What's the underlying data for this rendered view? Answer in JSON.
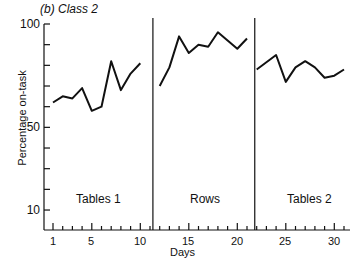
{
  "title": "(b) Class 2",
  "chart_data": {
    "type": "line",
    "title": "(b) Class 2",
    "xlabel": "Days",
    "ylabel": "Percentage on-task",
    "ylim": [
      0,
      100
    ],
    "xlim": [
      0,
      32
    ],
    "y_ticks": [
      10,
      50,
      100
    ],
    "x_ticks": [
      1,
      5,
      10,
      15,
      20,
      25,
      30
    ],
    "grid": false,
    "phase_dividers": [
      11.3,
      21.8
    ],
    "phases": [
      {
        "name": "Tables 1",
        "x": [
          1,
          2,
          3,
          4,
          5,
          6,
          7,
          8,
          9,
          10
        ],
        "values": [
          62,
          65,
          64,
          69,
          58,
          60,
          82,
          68,
          76,
          81
        ]
      },
      {
        "name": "Rows",
        "x": [
          12,
          13,
          14,
          15,
          16,
          17,
          18,
          19,
          20,
          21
        ],
        "values": [
          70,
          79,
          94,
          86,
          90,
          89,
          96,
          92,
          88,
          93
        ]
      },
      {
        "name": "Tables 2",
        "x": [
          22,
          24,
          25,
          26,
          27,
          28,
          29,
          30,
          31
        ],
        "values": [
          78,
          85,
          72,
          79,
          82,
          79,
          74,
          75,
          78
        ]
      }
    ]
  },
  "labels": {
    "y100": "100",
    "y50": "50",
    "y10": "10",
    "x1": "1",
    "x5": "5",
    "x10": "10",
    "x15": "15",
    "x20": "20",
    "x25": "25",
    "x30": "30",
    "phase1": "Tables 1",
    "phase2": "Rows",
    "phase3": "Tables 2",
    "xlabel": "Days",
    "ylabel": "Percentage on-task"
  }
}
